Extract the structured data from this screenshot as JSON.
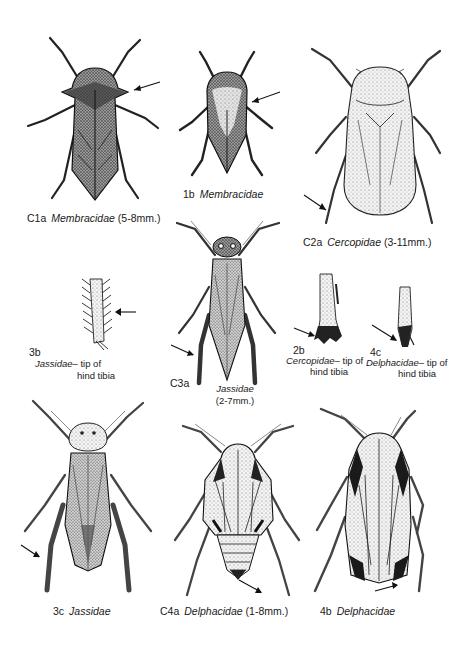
{
  "plate": {
    "figures": [
      {
        "id": "C1a",
        "family": "Membracidae",
        "size": "(5-8mm.)"
      },
      {
        "id": "1b",
        "family": "Membracidae",
        "size": ""
      },
      {
        "id": "C2a",
        "family": "Cercopidae",
        "size": "(3-11mm.)"
      },
      {
        "id": "3b",
        "family": "Jassidae",
        "caption": "– tip of",
        "caption2": "hind tibia"
      },
      {
        "id": "C3a",
        "family": "Jassidae",
        "size": "(2-7mm.)"
      },
      {
        "id": "2b",
        "family": "Cercopidae",
        "caption": "– tip of",
        "caption2": "hind tibia"
      },
      {
        "id": "4c",
        "family": "Delphacidae",
        "caption": "– tip of",
        "caption2": "hind tibia"
      },
      {
        "id": "3c",
        "family": "Jassidae",
        "size": ""
      },
      {
        "id": "C4a",
        "family": "Delphacidae",
        "size": "(1-8mm.)"
      },
      {
        "id": "4b",
        "family": "Delphacidae",
        "size": ""
      }
    ]
  }
}
